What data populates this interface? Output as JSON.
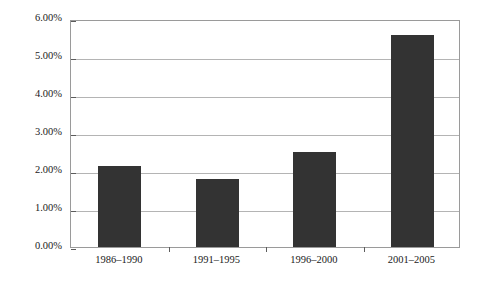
{
  "chart_data": {
    "type": "bar",
    "title": "",
    "subtitle": "",
    "xlabel": "",
    "ylabel": "",
    "categories": [
      "1986–1990",
      "1991–1995",
      "1996–2000",
      "2001–2005"
    ],
    "values": [
      2.13,
      1.79,
      2.51,
      5.58
    ],
    "value_labels": [
      "",
      "",
      "",
      ""
    ],
    "ylim": [
      0,
      6
    ],
    "ytick_values": [
      0,
      1,
      2,
      3,
      4,
      5,
      6
    ],
    "ytick_labels": [
      "0.00%",
      "1.00%",
      "2.00%",
      "3.00%",
      "4.00%",
      "5.00%",
      "6.00%"
    ],
    "grid": true,
    "legend": false,
    "legend_position": "none",
    "series": [
      {
        "name": "",
        "values": [
          2.13,
          1.79,
          2.51,
          5.58
        ]
      }
    ],
    "colors": {
      "bar_fill": "#333333",
      "gridline": "#b4b4b4",
      "axis_border": "#9a9a9a",
      "tick_mark": "#5c5c5c",
      "text": "#1a1a1a",
      "background": "#ffffff"
    }
  }
}
